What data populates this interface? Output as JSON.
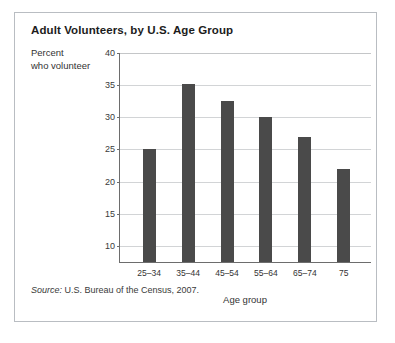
{
  "figure": {
    "title": "Adult Volunteers, by U.S. Age Group",
    "ylabel_line1": "Percent",
    "ylabel_line2": "who volunteer",
    "source_label": "Source:",
    "source_text": " U.S. Bureau of the Census, 2007.",
    "bar_color": "#4a4a4a",
    "grid_color": "#d2d4d6",
    "axis_color": "#6d6d6d",
    "border_color": "#b9bdc2"
  },
  "chart_data": {
    "type": "bar",
    "title": "Adult Volunteers, by U.S. Age Group",
    "categories": [
      "25–34",
      "35–44",
      "45–54",
      "55–64",
      "65–74",
      "75"
    ],
    "values": [
      25,
      35.2,
      32.5,
      30,
      27,
      22
    ],
    "xlabel": "Age group",
    "ylabel": "Percent who volunteer",
    "ylim": [
      7.5,
      40
    ],
    "yticks": [
      10,
      15,
      20,
      25,
      30,
      35,
      40
    ],
    "ytick_labels": [
      "10",
      "15",
      "20",
      "25",
      "30",
      "35",
      "40"
    ],
    "grid": "horizontal",
    "legend": "none",
    "source": "Source: U.S. Bureau of the Census, 2007."
  }
}
